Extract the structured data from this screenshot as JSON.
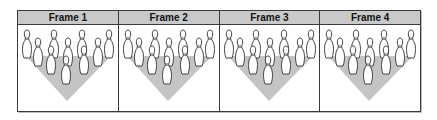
{
  "frames": [
    {
      "label": "Frame 1",
      "pins_standing": 10
    },
    {
      "label": "Frame 2",
      "pins_standing": 10
    },
    {
      "label": "Frame 3",
      "pins_standing": 10
    },
    {
      "label": "Frame 4",
      "pins_standing": 10
    }
  ],
  "colors": {
    "header_bg": "#c9c9c9",
    "lane_shade": "#c4c4c4",
    "pin_fill": "#ffffff",
    "pin_outline": "#333333",
    "border": "#3a3a3a"
  }
}
